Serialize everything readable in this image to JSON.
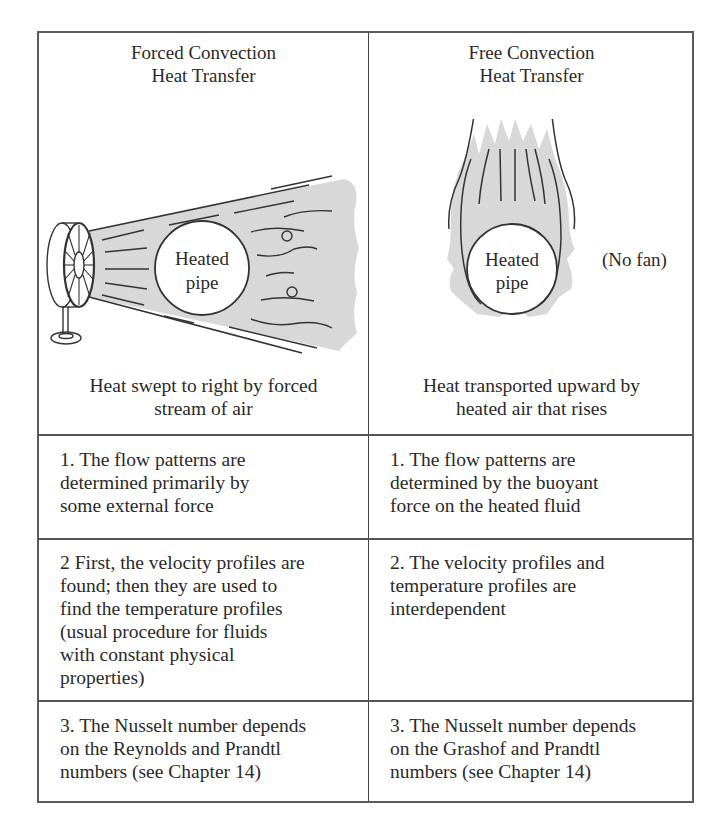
{
  "table": {
    "columns": [
      {
        "header_line1": "Forced Convection",
        "header_line2": "Heat Transfer",
        "illustration": {
          "type": "fan-blowing-air-past-pipe",
          "pipe_label_line1": "Heated",
          "pipe_label_line2": "pipe"
        },
        "caption_line1": "Heat swept to right by forced",
        "caption_line2": "stream of air",
        "items": [
          {
            "lines": [
              "1. The flow patterns are",
              "determined primarily by",
              "some external force"
            ]
          },
          {
            "lines": [
              "2 First, the velocity profiles are",
              "found; then they are used to",
              "find the temperature profiles",
              "(usual procedure for fluids",
              "with constant physical",
              "properties)"
            ]
          },
          {
            "lines": [
              "3. The Nusselt number depends",
              "on the Reynolds and Prandtl",
              "numbers (see Chapter 14)"
            ]
          }
        ]
      },
      {
        "header_line1": "Free Convection",
        "header_line2": "Heat Transfer",
        "illustration": {
          "type": "rising-plume-around-pipe",
          "pipe_label_line1": "Heated",
          "pipe_label_line2": "pipe",
          "side_note": "(No fan)"
        },
        "caption_line1": "Heat transported upward by",
        "caption_line2": "heated air that rises",
        "items": [
          {
            "lines": [
              "1. The flow patterns are",
              "determined by the buoyant",
              "force on the heated fluid"
            ]
          },
          {
            "lines": [
              "2. The velocity profiles and",
              "temperature profiles are",
              "interdependent"
            ]
          },
          {
            "lines": [
              "3. The Nusselt number depends",
              "on the Grashof and Prandtl",
              "numbers (see Chapter 14)"
            ]
          }
        ]
      }
    ]
  },
  "colors": {
    "border": "#555555",
    "text": "#2a2a2a",
    "air_fill": "#d8d8d8",
    "stroke": "#333333"
  }
}
